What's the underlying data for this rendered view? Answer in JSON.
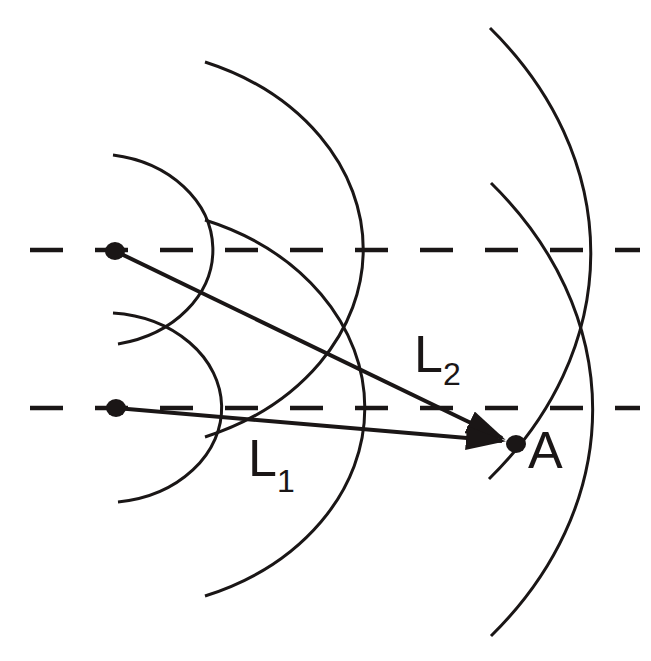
{
  "diagram": {
    "colors": {
      "background": "#ffffff",
      "ink": "#1a1616"
    },
    "sources": [
      {
        "id": "S1",
        "x": 115,
        "y": 251
      },
      {
        "id": "S2",
        "x": 116,
        "y": 408
      }
    ],
    "reference_lines": [
      {
        "y": 251,
        "style": "dashed"
      },
      {
        "y": 408,
        "style": "dashed"
      }
    ],
    "point": {
      "label": "A",
      "x": 516,
      "y": 444
    },
    "labels": {
      "L1": {
        "main": "L",
        "sub": "1"
      },
      "L2": {
        "main": "L",
        "sub": "2"
      },
      "A": "A"
    }
  }
}
